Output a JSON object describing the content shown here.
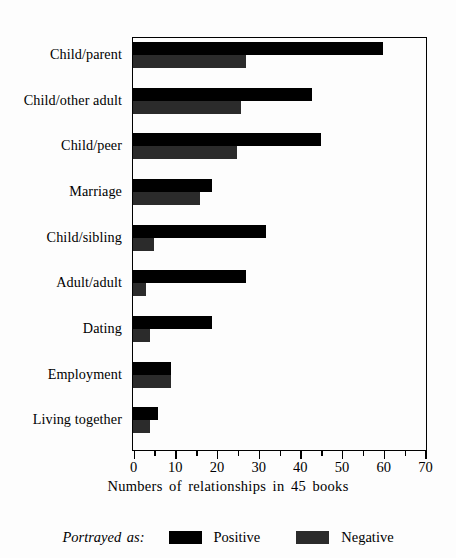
{
  "chart_data": {
    "type": "bar",
    "orientation": "horizontal",
    "title": "",
    "subtitle": "",
    "xlabel": "Numbers of relationships in 45 books",
    "ylabel": "",
    "xlim": [
      0,
      70
    ],
    "xticks": [
      0,
      10,
      20,
      30,
      40,
      50,
      60,
      70
    ],
    "xtick_labels": [
      "0",
      "10",
      "20",
      "30",
      "40",
      "50",
      "60",
      "70"
    ],
    "minor_tick_interval": 5,
    "grid": false,
    "legend_position": "bottom-center",
    "legend_title": "Portrayed as:",
    "categories": [
      "Child/parent",
      "Child/other adult",
      "Child/peer",
      "Marriage",
      "Child/sibling",
      "Adult/adult",
      "Dating",
      "Employment",
      "Living together"
    ],
    "series": [
      {
        "name": "Positive",
        "color": "#000000",
        "values": [
          60,
          43,
          45,
          19,
          32,
          27,
          19,
          9,
          6
        ]
      },
      {
        "name": "Negative",
        "color": "#2b2b2b",
        "values": [
          27,
          26,
          25,
          16,
          5,
          3,
          4,
          9,
          4
        ]
      }
    ]
  },
  "axis": {
    "x_title": "Numbers of relationships in 45 books"
  },
  "legend": {
    "title": "Portrayed as:",
    "entries": [
      {
        "label": "Positive",
        "color": "#000000"
      },
      {
        "label": "Negative",
        "color": "#2b2b2b"
      }
    ]
  },
  "colors": {
    "background": "#fdfdfd",
    "frame": "#000000",
    "positive": "#000000",
    "negative": "#2b2b2b"
  }
}
